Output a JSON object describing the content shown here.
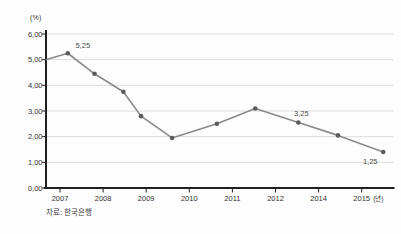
{
  "chart_data": {
    "type": "line",
    "title": "",
    "y_axis": {
      "unit": "(%)",
      "min": 0,
      "max": 6,
      "ticks": [
        "0,00",
        "1,00",
        "2,00",
        "3,00",
        "4,00",
        "5,00",
        "6,00"
      ]
    },
    "x_axis": {
      "ticks": [
        "2007",
        "2008",
        "2009",
        "2010",
        "2011",
        "2012",
        "2014",
        "2015"
      ],
      "unit": "(년)"
    },
    "series": [
      {
        "points": [
          {
            "x": -0.33,
            "v": 5.0,
            "marker": false
          },
          {
            "x": 0.18,
            "v": 5.25,
            "label": "5,25",
            "label_dx": 15,
            "label_dy": -5
          },
          {
            "x": 0.8,
            "v": 4.45
          },
          {
            "x": 1.47,
            "v": 3.75
          },
          {
            "x": 1.88,
            "v": 2.8
          },
          {
            "x": 2.6,
            "v": 1.95
          },
          {
            "x": 3.64,
            "v": 2.5
          },
          {
            "x": 4.53,
            "v": 3.1
          },
          {
            "x": 5.53,
            "v": 2.55,
            "label": "3,25",
            "label_dx": 3,
            "label_dy": -7
          },
          {
            "x": 6.45,
            "v": 2.05
          },
          {
            "x": 7.5,
            "v": 1.4,
            "label": "1,25",
            "label_dx": -13,
            "label_dy": 12
          }
        ]
      }
    ],
    "annotations": [
      "5,25",
      "3,25",
      "1,25"
    ],
    "source": "자료: 한국은행",
    "colors": {
      "grid": "#dcdcdc",
      "axis": "#1f1f1f",
      "line": "#8a8a8a",
      "marker": "#5c5c5c",
      "text": "#333333",
      "label_text": "#4d4d4d"
    }
  }
}
